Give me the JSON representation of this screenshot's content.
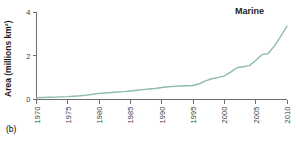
{
  "panel": {
    "label": "(b)"
  },
  "chart_data": {
    "type": "line",
    "title": "",
    "subtitle": "",
    "xlabel": "",
    "ylabel": "Area (millions km²)",
    "xlim": [
      1970,
      2010
    ],
    "ylim": [
      0,
      4
    ],
    "yticks": [
      0,
      2,
      4
    ],
    "ytick_labels": [
      "0",
      "2",
      "4"
    ],
    "xticks": [
      1970,
      1975,
      1980,
      1985,
      1990,
      1995,
      2000,
      2005,
      2010
    ],
    "xtick_labels": [
      "1970",
      "1975",
      "1980",
      "1985",
      "1990",
      "1995",
      "2000",
      "2005",
      "2010"
    ],
    "grid": false,
    "legend_position": "inside-top-right",
    "annotations": [
      {
        "text": "Marine",
        "x": 2004,
        "y": 3.9
      }
    ],
    "series": [
      {
        "name": "Marine",
        "color": "#8fbca4",
        "x": [
          1970,
          1971,
          1972,
          1973,
          1974,
          1975,
          1976,
          1977,
          1978,
          1979,
          1980,
          1981,
          1982,
          1983,
          1984,
          1985,
          1986,
          1987,
          1988,
          1989,
          1990,
          1991,
          1992,
          1993,
          1994,
          1995,
          1996,
          1997,
          1998,
          1999,
          2000,
          2001,
          2002,
          2003,
          2004,
          2005,
          2006,
          2007,
          2008,
          2009,
          2010
        ],
        "values": [
          0.08,
          0.09,
          0.1,
          0.11,
          0.12,
          0.13,
          0.15,
          0.17,
          0.2,
          0.24,
          0.28,
          0.3,
          0.32,
          0.34,
          0.36,
          0.39,
          0.42,
          0.45,
          0.48,
          0.5,
          0.55,
          0.58,
          0.6,
          0.62,
          0.63,
          0.64,
          0.72,
          0.85,
          0.95,
          1.0,
          1.08,
          1.25,
          1.45,
          1.5,
          1.55,
          1.78,
          2.05,
          2.1,
          2.45,
          2.9,
          3.35
        ]
      }
    ]
  }
}
